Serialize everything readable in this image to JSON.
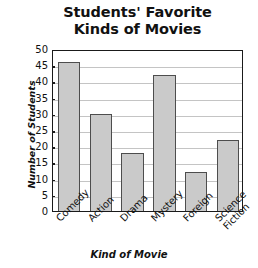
{
  "chart_data": {
    "type": "bar",
    "title": "Students' Favorite Kinds of Movies",
    "title_lines": [
      "Students' Favorite",
      "Kinds of Movies"
    ],
    "xlabel": "Kind of Movie",
    "ylabel": "Number of Students",
    "categories": [
      "Comedy",
      "Action",
      "Drama",
      "Mystery",
      "Foreign",
      "Science Fiction"
    ],
    "values": [
      46,
      30,
      18,
      42,
      12,
      22
    ],
    "ylim": [
      0,
      50
    ],
    "ytick_labels": [
      "50",
      "45",
      "40",
      "35",
      "30",
      "25",
      "20",
      "15",
      "10",
      "5",
      "0"
    ],
    "ytick_values": [
      50,
      45,
      40,
      35,
      30,
      25,
      20,
      15,
      10,
      5,
      0
    ],
    "ytick_step": 5,
    "grid": true,
    "legend": false,
    "bar_color": "#cacaca",
    "bar_edge_color": "#4d4d4d",
    "axis_color": "#1a1a1a",
    "grid_color": "#c4c4c4",
    "background_color": "#ffffff",
    "category_label_lines": [
      [
        "Comedy"
      ],
      [
        "Action"
      ],
      [
        "Drama"
      ],
      [
        "Mystery"
      ],
      [
        "Foreign"
      ],
      [
        "Science",
        "Fiction"
      ]
    ]
  }
}
